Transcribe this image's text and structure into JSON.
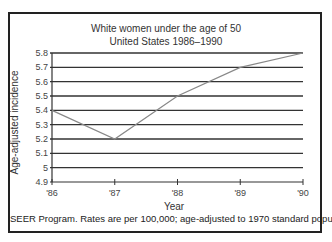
{
  "chart_data": {
    "type": "line",
    "title": "White women under the age of 50",
    "subtitle": "United States 1986–1990",
    "xlabel": "Year",
    "ylabel": "Age-adjusted incidence",
    "categories": [
      "'86",
      "'87",
      "'88",
      "'89",
      "'90"
    ],
    "series": [
      {
        "name": "Age-adjusted incidence",
        "values": [
          5.4,
          5.2,
          5.5,
          5.7,
          5.8
        ]
      }
    ],
    "ylim": [
      4.9,
      5.8
    ],
    "yticks": [
      "5.8",
      "5.7",
      "5.6",
      "5.5",
      "5.4",
      "5.3",
      "5.2",
      "5.1",
      "5",
      "4.9"
    ],
    "grid": true,
    "legend": "none",
    "footnote": "SEER Program. Rates are per 100,000; age-adjusted to 1970 standard population."
  },
  "colors": {
    "line": "#888888",
    "grid": "#333333",
    "frame": "#222222"
  }
}
